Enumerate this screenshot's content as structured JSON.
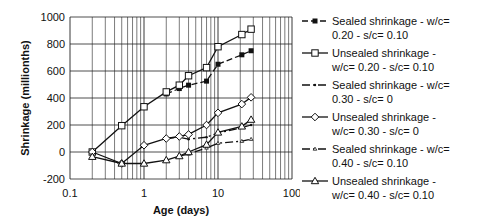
{
  "chart_data": {
    "type": "line",
    "title": "",
    "xlabel": "Age (days)",
    "ylabel": "Shrinkage (millionths)",
    "xscale": "log",
    "xlim": [
      0.1,
      100
    ],
    "ylim": [
      -200,
      1000
    ],
    "xticks": [
      "0.1",
      "1",
      "10",
      "100"
    ],
    "yticks": [
      "-200",
      "0",
      "200",
      "400",
      "600",
      "800",
      "1000"
    ],
    "grid": true,
    "legend_position": "right",
    "series": [
      {
        "name": "Sealed shrinkage -  w/c= 0.20 - s/c= 0.10",
        "label_lines": "Sealed shrinkage -  w/c=\n0.20 - s/c= 0.10",
        "marker": "filled-square",
        "dash": "6,3",
        "x": [
          2,
          3,
          4,
          7,
          10,
          21,
          28
        ],
        "y": [
          430,
          470,
          495,
          525,
          650,
          720,
          750
        ]
      },
      {
        "name": "Unsealed  shrinkage - w/c= 0.20 - s/c= 0.10",
        "label_lines": "Unsealed  shrinkage -\nw/c= 0.20 - s/c= 0.10",
        "marker": "open-square",
        "dash": "",
        "x": [
          0.2,
          0.5,
          1,
          2,
          3,
          4,
          7,
          10,
          21,
          28
        ],
        "y": [
          0,
          195,
          335,
          445,
          495,
          565,
          625,
          780,
          870,
          910
        ]
      },
      {
        "name": "Sealed shrinkage -  w/c= 0.30 - s/c= 0",
        "label_lines": "Sealed shrinkage -  w/c=\n0.30 - s/c= 0",
        "marker": "dot",
        "dash": "8,3,2,3",
        "x": [
          2,
          3,
          4,
          7,
          10,
          21,
          28
        ],
        "y": [
          100,
          110,
          95,
          110,
          140,
          180,
          200
        ]
      },
      {
        "name": "Unsealed shrinkage - w/c= 0.30 - s/c= 0",
        "label_lines": "Unsealed shrinkage -\nw/c= 0.30 - s/c= 0",
        "marker": "open-diamond",
        "dash": "",
        "x": [
          0.2,
          0.5,
          1,
          2,
          3,
          4,
          7,
          10,
          21,
          28
        ],
        "y": [
          0,
          -85,
          50,
          100,
          115,
          130,
          200,
          290,
          355,
          405
        ]
      },
      {
        "name": "Sealed shrinkage - w/c= 0.40 - s/c= 0.10",
        "label_lines": "Sealed shrinkage - w/c=\n0.40 - s/c= 0.10",
        "marker": "small-triangle",
        "dash": "8,3,2,3",
        "x": [
          3,
          4,
          7,
          10,
          21,
          28
        ],
        "y": [
          -30,
          -15,
          30,
          65,
          80,
          95
        ]
      },
      {
        "name": "Unsealed shrinkage - w/c= 0.40 - s/c= 0.10",
        "label_lines": "Unsealed shrinkage -\nw/c= 0.40 - s/c= 0.10",
        "marker": "open-triangle",
        "dash": "",
        "x": [
          0.2,
          0.5,
          1,
          2,
          3,
          4,
          7,
          10,
          21,
          28
        ],
        "y": [
          -35,
          -85,
          -85,
          -60,
          -30,
          0,
          55,
          145,
          190,
          240
        ]
      }
    ]
  },
  "colors": {
    "line": "#111111",
    "grid": "#222222",
    "background": "#ffffff"
  }
}
